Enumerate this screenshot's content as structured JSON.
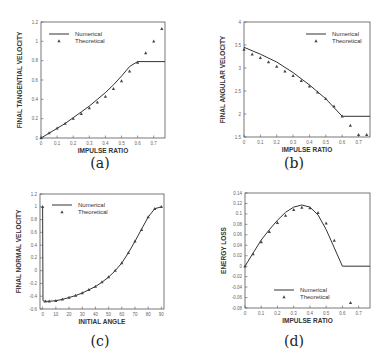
{
  "chart_data": [
    {
      "id": "a",
      "caption": "(a)",
      "type": "line",
      "title": "",
      "xlabel": "IMPULSE RATIO",
      "ylabel": "FINAL TANGENTIAL VELOCITY",
      "xlim": [
        0,
        0.77
      ],
      "ylim": [
        0,
        1.2
      ],
      "xticks": [
        "0",
        "0.1",
        "0.2",
        "0.3",
        "0.4",
        "0.5",
        "0.6",
        "0.7"
      ],
      "yticks": [
        "0",
        "0.2",
        "0.4",
        "0.6",
        "0.8",
        "1",
        "1.2"
      ],
      "legend": {
        "position": "upper-left",
        "entries": [
          "Numerical",
          "Theoretical"
        ]
      },
      "grid": false,
      "series": [
        {
          "name": "Numerical",
          "style": "line",
          "x": [
            0,
            0.05,
            0.1,
            0.15,
            0.2,
            0.25,
            0.3,
            0.35,
            0.4,
            0.45,
            0.5,
            0.55,
            0.6,
            0.77
          ],
          "y": [
            0,
            0.05,
            0.1,
            0.15,
            0.21,
            0.27,
            0.33,
            0.4,
            0.47,
            0.55,
            0.64,
            0.74,
            0.79,
            0.79
          ]
        },
        {
          "name": "Theoretical",
          "style": "triangle",
          "x": [
            0,
            0.05,
            0.1,
            0.15,
            0.2,
            0.25,
            0.3,
            0.35,
            0.4,
            0.45,
            0.5,
            0.55,
            0.6,
            0.65,
            0.7,
            0.75
          ],
          "y": [
            0,
            0.05,
            0.1,
            0.15,
            0.2,
            0.25,
            0.31,
            0.37,
            0.43,
            0.51,
            0.59,
            0.69,
            0.78,
            0.88,
            1.0,
            1.13
          ]
        }
      ]
    },
    {
      "id": "b",
      "caption": "(b)",
      "type": "line",
      "title": "",
      "xlabel": "IMPULSE RATIO",
      "ylabel": "FINAL ANGULAR VELOCITY",
      "xlim": [
        0,
        0.77
      ],
      "ylim": [
        1.5,
        4
      ],
      "xticks": [
        "0",
        "0.1",
        "0.2",
        "0.3",
        "0.4",
        "0.5",
        "0.6",
        "0.7"
      ],
      "yticks": [
        "1.5",
        "2",
        "2.5",
        "3",
        "3.5",
        "4"
      ],
      "legend": {
        "position": "upper-right",
        "entries": [
          "Numerical",
          "Theoretical"
        ]
      },
      "grid": false,
      "series": [
        {
          "name": "Numerical",
          "style": "line",
          "x": [
            0,
            0.1,
            0.2,
            0.3,
            0.4,
            0.5,
            0.6,
            0.77
          ],
          "y": [
            3.45,
            3.3,
            3.13,
            2.9,
            2.63,
            2.33,
            1.95,
            1.95
          ]
        },
        {
          "name": "Theoretical",
          "style": "triangle",
          "x": [
            0,
            0.05,
            0.1,
            0.15,
            0.2,
            0.25,
            0.3,
            0.35,
            0.4,
            0.45,
            0.5,
            0.55,
            0.6,
            0.65,
            0.7,
            0.75
          ],
          "y": [
            3.4,
            3.3,
            3.22,
            3.13,
            3.03,
            2.93,
            2.83,
            2.72,
            2.6,
            2.47,
            2.33,
            2.17,
            1.95,
            1.75,
            1.55,
            1.55
          ]
        }
      ]
    },
    {
      "id": "c",
      "caption": "(c)",
      "type": "line",
      "title": "",
      "xlabel": "INITIAL ANGLE",
      "ylabel": "FINAL NORMAL VELOCITY",
      "xlim": [
        -2,
        92
      ],
      "ylim": [
        -0.6,
        1.2
      ],
      "xticks": [
        "0",
        "10",
        "20",
        "30",
        "40",
        "50",
        "60",
        "70",
        "80",
        "90"
      ],
      "yticks": [
        "-0.6",
        "-0.4",
        "-0.2",
        "0",
        "0.2",
        "0.4",
        "0.6",
        "0.8",
        "1",
        "1.2"
      ],
      "legend": {
        "position": "upper-left",
        "entries": [
          "Numerical",
          "Theoretical"
        ]
      },
      "grid": false,
      "series": [
        {
          "name": "Numerical",
          "style": "line",
          "x": [
            0,
            0.3,
            1,
            5,
            10,
            15,
            20,
            25,
            30,
            35,
            40,
            45,
            50,
            55,
            60,
            65,
            70,
            75,
            80,
            85,
            90
          ],
          "y": [
            1,
            -0.47,
            -0.48,
            -0.48,
            -0.47,
            -0.45,
            -0.42,
            -0.39,
            -0.35,
            -0.3,
            -0.25,
            -0.18,
            -0.1,
            0,
            0.12,
            0.28,
            0.46,
            0.65,
            0.84,
            0.97,
            1
          ]
        },
        {
          "name": "Theoretical",
          "style": "triangle",
          "x": [
            0,
            2,
            5,
            10,
            15,
            20,
            25,
            30,
            35,
            40,
            45,
            50,
            55,
            60,
            65,
            70,
            75,
            80,
            85,
            90
          ],
          "y": [
            1,
            -0.48,
            -0.48,
            -0.47,
            -0.45,
            -0.42,
            -0.39,
            -0.35,
            -0.3,
            -0.25,
            -0.18,
            -0.1,
            0,
            0.12,
            0.28,
            0.46,
            0.64,
            0.84,
            0.97,
            1
          ]
        }
      ]
    },
    {
      "id": "d",
      "caption": "(d)",
      "type": "line",
      "title": "",
      "xlabel": "IMPULSE RATIO",
      "ylabel": "ENERGY LOSS",
      "xlim": [
        0,
        0.77
      ],
      "ylim": [
        -0.08,
        0.14
      ],
      "xticks": [
        "0",
        "0.1",
        "0.2",
        "0.3",
        "0.4",
        "0.5",
        "0.6",
        "0.7"
      ],
      "yticks": [
        "-0.08",
        "-0.06",
        "-0.04",
        "-0.02",
        "0",
        "0.02",
        "0.04",
        "0.06",
        "0.08",
        "0.1",
        "0.12",
        "0.14"
      ],
      "legend": {
        "position": "lower-center",
        "entries": [
          "Numerical",
          "Theoretical"
        ]
      },
      "grid": false,
      "series": [
        {
          "name": "Numerical",
          "style": "line",
          "x": [
            0,
            0.05,
            0.1,
            0.15,
            0.2,
            0.25,
            0.3,
            0.35,
            0.4,
            0.45,
            0.5,
            0.55,
            0.6,
            0.77
          ],
          "y": [
            0,
            0.025,
            0.05,
            0.07,
            0.088,
            0.103,
            0.113,
            0.117,
            0.113,
            0.098,
            0.07,
            0.035,
            0,
            0
          ]
        },
        {
          "name": "Theoretical",
          "style": "triangle",
          "x": [
            0,
            0.05,
            0.1,
            0.15,
            0.2,
            0.25,
            0.3,
            0.35,
            0.4,
            0.45,
            0.5,
            0.55,
            0.65
          ],
          "y": [
            0,
            0.023,
            0.046,
            0.066,
            0.083,
            0.097,
            0.108,
            0.112,
            0.111,
            0.102,
            0.082,
            0.049,
            -0.07
          ]
        }
      ]
    }
  ]
}
